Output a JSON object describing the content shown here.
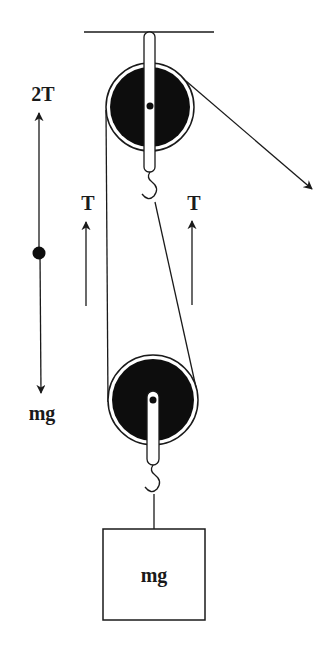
{
  "diagram": {
    "type": "pulley-system-free-body",
    "colors": {
      "ink": "#1a1a1a",
      "pulley_fill": "#0d0d0d",
      "background": "#ffffff"
    },
    "labels": {
      "upward_force": "2T",
      "downward_force": "mg",
      "tension_left": "T",
      "tension_right": "T",
      "block": "mg"
    },
    "components": {
      "ceiling": "fixed support",
      "top_pulley": "fixed pulley",
      "bottom_pulley": "movable pulley",
      "rope": "rope with pulled end",
      "block": "hanging mass"
    }
  }
}
